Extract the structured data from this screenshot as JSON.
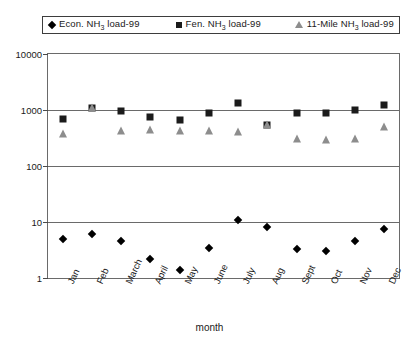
{
  "legend": {
    "entries": [
      {
        "label_prefix": "Econ. NH",
        "label_sub": "3",
        "label_suffix": " load-99",
        "marker": "diamond-marker-icon",
        "color": "#000000"
      },
      {
        "label_prefix": "Fen. NH",
        "label_sub": "3",
        "label_suffix": " load-99",
        "marker": "square-marker-icon",
        "color": "#1b1b1b"
      },
      {
        "label_prefix": "11-Mile NH",
        "label_sub": "3",
        "label_suffix": " load-99",
        "marker": "triangle-marker-icon",
        "color": "#8d8d8d"
      }
    ]
  },
  "axes": {
    "y_ticks": [
      "10000",
      "1000",
      "100",
      "10",
      "1"
    ],
    "x_title": "month"
  },
  "chart_data": {
    "type": "scatter",
    "title": "",
    "xlabel": "month",
    "ylabel": "",
    "yscale": "log",
    "ylim": [
      1,
      10000
    ],
    "grid": true,
    "legend_position": "top",
    "categories": [
      "Jan",
      "Feb",
      "March",
      "April",
      "May",
      "June",
      "July",
      "Aug",
      "Sept",
      "Oct",
      "Nov",
      "Dec"
    ],
    "series": [
      {
        "name": "Econ. NH3 load-99",
        "marker": "diamond",
        "color": "#000000",
        "values": [
          5,
          6,
          4.5,
          2.2,
          1.4,
          3.5,
          11,
          8,
          3.3,
          3,
          4.5,
          7.5
        ]
      },
      {
        "name": "Fen. NH3 load-99",
        "marker": "square",
        "color": "#1b1b1b",
        "values": [
          680,
          1100,
          950,
          740,
          660,
          900,
          1350,
          550,
          880,
          900,
          980,
          1250
        ]
      },
      {
        "name": "11-Mile NH3 load-99",
        "marker": "triangle",
        "color": "#8d8d8d",
        "values": [
          380,
          1100,
          420,
          440,
          420,
          420,
          400,
          550,
          300,
          290,
          300,
          500
        ]
      }
    ]
  }
}
